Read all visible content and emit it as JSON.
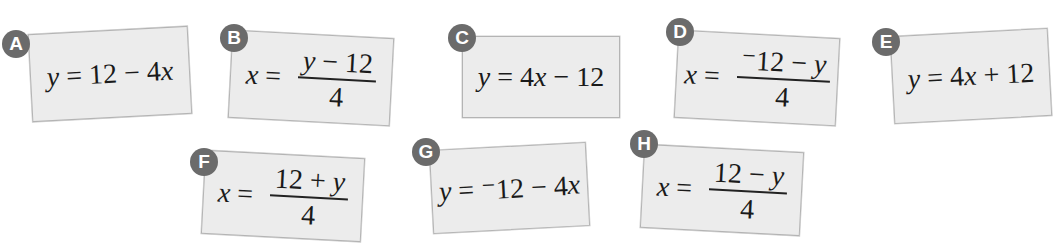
{
  "cards": [
    {
      "letter": "A",
      "lhs": "y",
      "eq": " = ",
      "rhs": "12 − 4",
      "rhs_var": "x",
      "rhs_tail": ""
    },
    {
      "letter": "B",
      "lhs": "x",
      "eq": " = ",
      "num_pre": "",
      "num_var": "y",
      "num_post": " − 12",
      "den": "4"
    },
    {
      "letter": "C",
      "lhs": "y",
      "eq": " = ",
      "rhs": "4",
      "rhs_var": "x",
      "rhs_tail": " − 12"
    },
    {
      "letter": "D",
      "lhs": "x",
      "eq": " = ",
      "num_pre": "⁻12 − ",
      "num_var": "y",
      "num_post": "",
      "den": "4"
    },
    {
      "letter": "E",
      "lhs": "y",
      "eq": " = ",
      "rhs": "4",
      "rhs_var": "x",
      "rhs_tail": " + 12"
    },
    {
      "letter": "F",
      "lhs": "x",
      "eq": " = ",
      "num_pre": "12 + ",
      "num_var": "y",
      "num_post": "",
      "den": "4"
    },
    {
      "letter": "G",
      "lhs": "y",
      "eq": " = ",
      "rhs": "⁻12 − 4",
      "rhs_var": "x",
      "rhs_tail": ""
    },
    {
      "letter": "H",
      "lhs": "x",
      "eq": " = ",
      "num_pre": "12 − ",
      "num_var": "y",
      "num_post": "",
      "den": "4"
    }
  ],
  "colors": {
    "card_bg": "#ececec",
    "badge_bg": "#6b6b6b",
    "card_border": "#b4b4b4"
  }
}
